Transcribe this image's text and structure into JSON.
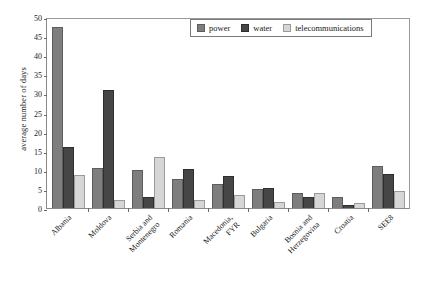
{
  "chart_data": {
    "type": "bar",
    "title": "",
    "xlabel": "",
    "ylabel": "average number of days",
    "ylim": [
      0,
      50
    ],
    "yticks": [
      0,
      5,
      10,
      15,
      20,
      25,
      30,
      35,
      40,
      45,
      50
    ],
    "grid": false,
    "legend_position": "top-right",
    "categories": [
      "Albania",
      "Moldova",
      "Serbia and Montenegro",
      "Romania",
      "Macedonia, FYR",
      "Bulgaria",
      "Bosnia and Herzegovina",
      "Croatia",
      "SEE8"
    ],
    "category_lines": [
      [
        "Albania"
      ],
      [
        "Moldova"
      ],
      [
        "Serbia and",
        "Montenegro"
      ],
      [
        "Romania"
      ],
      [
        "Macedonia,",
        "FYR"
      ],
      [
        "Bulgaria"
      ],
      [
        "Bosnia and",
        "Herzegovina"
      ],
      [
        "Croatia"
      ],
      [
        "SEE8"
      ]
    ],
    "series": [
      {
        "name": "power",
        "color": "#7e7e7e",
        "values": [
          47.5,
          10.5,
          10.0,
          7.5,
          6.2,
          5.0,
          4.0,
          3.0,
          11.0
        ]
      },
      {
        "name": "water",
        "color": "#464646",
        "values": [
          16.0,
          31.0,
          3.0,
          10.3,
          8.5,
          5.3,
          2.8,
          0.8,
          8.8
        ]
      },
      {
        "name": "telecommunications",
        "color": "#d6d6d6",
        "values": [
          8.7,
          2.0,
          13.3,
          2.0,
          3.5,
          1.7,
          3.8,
          1.2,
          4.5
        ]
      }
    ]
  }
}
